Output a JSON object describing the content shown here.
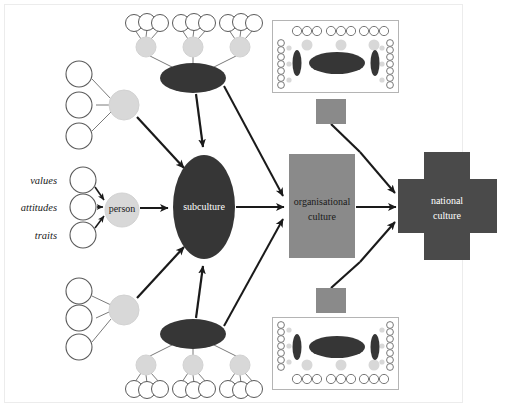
{
  "diagram": {
    "background_color": "#ffffff",
    "frame": {
      "present": true,
      "color": "#e8e8e8",
      "x": 4,
      "y": 4,
      "width": 458,
      "height": 398
    }
  },
  "palette": {
    "dark_ellipse": "#363636",
    "node_light": "#d8d8d8",
    "node_light_stroke": "#cfcfcf",
    "circle_stroke": "#5a5a5a",
    "circle_fill": "#ffffff",
    "org_box": "#8a8a8a",
    "national_cross": "#4a4a4a",
    "connector_square": "#8a8a8a",
    "arrow": "#1a1a1a",
    "thin_line": "#7a7a7a",
    "mini_box_stroke": "#b4b4b4",
    "text_on_dark": "#ffffff",
    "text_dark": "#1a1a1a"
  },
  "nodes": {
    "person": {
      "label": "person",
      "shape": "circle",
      "fill": "#d8d8d8",
      "text_color": "#1a1a1a",
      "cx": 122,
      "cy": 210,
      "r": 17
    },
    "subculture": {
      "label": "subculture",
      "shape": "ellipse",
      "fill": "#363636",
      "text_color": "#ffffff",
      "cx": 204,
      "cy": 207,
      "rx": 31,
      "ry": 52
    },
    "organisational_culture": {
      "label_line1": "organisational",
      "label_line2": "culture",
      "shape": "rect",
      "fill": "#8a8a8a",
      "text_color": "#1a1a1a",
      "x": 289,
      "y": 154,
      "width": 66,
      "height": 104
    },
    "national_culture": {
      "label_line1": "national",
      "label_line2": "culture",
      "shape": "cross",
      "fill": "#4a4a4a",
      "text_color": "#ffffff",
      "cx": 446,
      "cy": 206,
      "arm": 48,
      "thickness": 54
    }
  },
  "input_labels": [
    {
      "text": "values",
      "x": 58,
      "y": 184
    },
    {
      "text": "attitudes",
      "x": 58,
      "y": 211
    },
    {
      "text": "traits",
      "x": 58,
      "y": 239
    }
  ],
  "input_circles": [
    {
      "cx": 83,
      "cy": 180,
      "r": 13
    },
    {
      "cx": 83,
      "cy": 207,
      "r": 13
    },
    {
      "cx": 83,
      "cy": 235,
      "r": 13
    }
  ],
  "person_clusters": [
    {
      "name": "upper-left-person-cluster",
      "cx": 124,
      "cy": 105,
      "r": 15,
      "leaves": [
        {
          "cx": 79,
          "cy": 74
        },
        {
          "cx": 79,
          "cy": 105
        },
        {
          "cx": 79,
          "cy": 136
        }
      ]
    },
    {
      "name": "lower-left-person-cluster",
      "cx": 124,
      "cy": 310,
      "r": 15,
      "leaves": [
        {
          "cx": 79,
          "cy": 291
        },
        {
          "cx": 79,
          "cy": 318
        },
        {
          "cx": 79,
          "cy": 347
        }
      ]
    }
  ],
  "subculture_clusters": [
    {
      "name": "top-subculture-cluster",
      "cx": 193,
      "cy": 78,
      "rx": 33,
      "ry": 15,
      "persons": [
        {
          "cx": 146,
          "cy": 47,
          "r": 10,
          "leaves": [
            {
              "cx": 134,
              "cy": 23
            },
            {
              "cx": 147,
              "cy": 22
            },
            {
              "cx": 160,
              "cy": 23
            }
          ]
        },
        {
          "cx": 193,
          "cy": 47,
          "r": 10,
          "leaves": [
            {
              "cx": 181,
              "cy": 23
            },
            {
              "cx": 194,
              "cy": 22
            },
            {
              "cx": 207,
              "cy": 23
            }
          ]
        },
        {
          "cx": 240,
          "cy": 47,
          "r": 10,
          "leaves": [
            {
              "cx": 228,
              "cy": 23
            },
            {
              "cx": 241,
              "cy": 22
            },
            {
              "cx": 254,
              "cy": 23
            }
          ]
        }
      ]
    },
    {
      "name": "bottom-subculture-cluster",
      "cx": 193,
      "cy": 334,
      "rx": 33,
      "ry": 15,
      "persons": [
        {
          "cx": 146,
          "cy": 365,
          "r": 10,
          "leaves": [
            {
              "cx": 134,
              "cy": 389
            },
            {
              "cx": 147,
              "cy": 390
            },
            {
              "cx": 160,
              "cy": 389
            }
          ]
        },
        {
          "cx": 193,
          "cy": 365,
          "r": 10,
          "leaves": [
            {
              "cx": 181,
              "cy": 389
            },
            {
              "cx": 194,
              "cy": 390
            },
            {
              "cx": 207,
              "cy": 389
            }
          ]
        },
        {
          "cx": 240,
          "cy": 365,
          "r": 10,
          "leaves": [
            {
              "cx": 228,
              "cy": 389
            },
            {
              "cx": 241,
              "cy": 390
            },
            {
              "cx": 254,
              "cy": 389
            }
          ]
        }
      ]
    }
  ],
  "mini_diagrams": [
    {
      "name": "top-mini-organisation",
      "x": 272,
      "y": 20,
      "width": 126,
      "height": 72,
      "flip": false,
      "connector": {
        "x": 316,
        "y": 99,
        "width": 30,
        "height": 25
      }
    },
    {
      "name": "bottom-mini-organisation",
      "x": 272,
      "y": 318,
      "width": 126,
      "height": 72,
      "flip": true,
      "connector": {
        "x": 316,
        "y": 288,
        "width": 30,
        "height": 25
      }
    }
  ],
  "arrows": [
    {
      "from": "values-circle",
      "to": "person"
    },
    {
      "from": "attitudes-circle",
      "to": "person"
    },
    {
      "from": "traits-circle",
      "to": "person"
    },
    {
      "from": "person",
      "to": "subculture"
    },
    {
      "from": "upper-left-person-cluster",
      "to": "subculture"
    },
    {
      "from": "lower-left-person-cluster",
      "to": "subculture"
    },
    {
      "from": "top-subculture-cluster",
      "to": "subculture"
    },
    {
      "from": "bottom-subculture-cluster",
      "to": "subculture"
    },
    {
      "from": "subculture",
      "to": "organisational-culture"
    },
    {
      "from": "top-subculture-cluster",
      "to": "organisational-culture"
    },
    {
      "from": "bottom-subculture-cluster",
      "to": "organisational-culture"
    },
    {
      "from": "organisational-culture",
      "to": "national-culture"
    },
    {
      "from": "top-mini-organisation",
      "to": "national-culture"
    },
    {
      "from": "bottom-mini-organisation",
      "to": "national-culture"
    }
  ]
}
